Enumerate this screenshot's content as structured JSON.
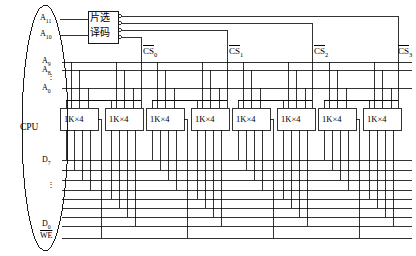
{
  "figure": {
    "domain": "diagram",
    "width": 416,
    "height": 256,
    "background": "#ffffff",
    "line_color": "#000000"
  },
  "cpu": {
    "label": "CPU",
    "shape": "ellipse",
    "pins": {
      "address_high": [
        "A11",
        "A10"
      ],
      "address_low_top": "A9",
      "address_low_second": "A8",
      "address_low_dots": "⋮",
      "address_low_bottom": "A0",
      "data_top": "D7",
      "data_dots": "⋮",
      "data_bottom": "D0",
      "write_enable": "WE",
      "write_enable_overline": true
    }
  },
  "decoder": {
    "line1": "片选",
    "line2": "译码",
    "outputs": 4,
    "output_labels": [
      "CS0",
      "CS1",
      "CS2",
      "CS3"
    ]
  },
  "chip_selects": [
    {
      "base": "CS",
      "index": "0",
      "overline": true
    },
    {
      "base": "CS",
      "index": "1",
      "overline": true
    },
    {
      "base": "CS",
      "index": "2",
      "overline": true
    },
    {
      "base": "CS",
      "index": "3",
      "overline": true
    }
  ],
  "memory_chips": [
    {
      "id": 1,
      "label": "1K×4",
      "group": 0
    },
    {
      "id": 2,
      "label": "1K×4",
      "group": 0
    },
    {
      "id": 3,
      "label": "1K×4",
      "group": 1
    },
    {
      "id": 4,
      "label": "1K×4",
      "group": 1
    },
    {
      "id": 5,
      "label": "1K×4",
      "group": 2
    },
    {
      "id": 6,
      "label": "1K×4",
      "group": 2
    },
    {
      "id": 7,
      "label": "1K×4",
      "group": 3
    },
    {
      "id": 8,
      "label": "1K×4",
      "group": 3
    }
  ],
  "buses": {
    "address_lines": 3,
    "data_lines": 8,
    "control_lines": 1,
    "data_bus_label_top": "D7",
    "data_bus_label_bottom": "D0",
    "control_label": "WE"
  }
}
